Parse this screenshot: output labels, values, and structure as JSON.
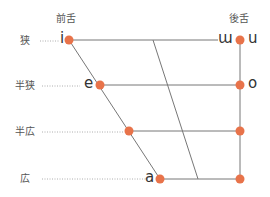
{
  "headers": {
    "front": "前舌",
    "back": "後舌"
  },
  "heights": [
    {
      "label": "狭",
      "y": 40
    },
    {
      "label": "半狭",
      "y": 85
    },
    {
      "label": "半広",
      "y": 131
    },
    {
      "label": "広",
      "y": 179
    }
  ],
  "vowels": {
    "i": "i",
    "e": "e",
    "a": "a",
    "unrounded_u": "ɯ",
    "u": "u",
    "o": "o"
  },
  "colors": {
    "dot": "#E8734A",
    "line": "#777777",
    "dotted": "#999999"
  }
}
